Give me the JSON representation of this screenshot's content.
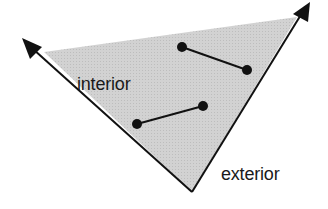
{
  "labels": {
    "interior": "interior",
    "exterior": "exterior"
  },
  "colors": {
    "fill": "#cfcfcf",
    "stroke": "#111111",
    "text": "#1a1a1a"
  },
  "geometry": {
    "vertex": [
      192,
      192
    ],
    "left_ray_tip": [
      24,
      40
    ],
    "right_ray_tip": [
      309,
      3
    ],
    "fill_top_left": [
      44,
      52
    ],
    "fill_top_right": [
      297,
      17
    ],
    "segments": [
      {
        "p1": [
          182,
          47
        ],
        "p2": [
          247,
          70
        ]
      },
      {
        "p1": [
          137,
          124
        ],
        "p2": [
          203,
          106
        ]
      }
    ]
  }
}
